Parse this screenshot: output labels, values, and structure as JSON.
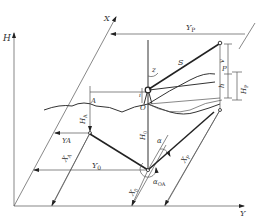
{
  "diagram": {
    "type": "surveying coordinate geometry diagram",
    "axes": {
      "vertical": "H",
      "horizontal": "Y",
      "oblique": "X"
    },
    "labels": {
      "Yp": "Y",
      "Yp_sub": "P",
      "S": "S",
      "z": "z",
      "v": "v",
      "P": "P",
      "h": "h",
      "Hp": "H",
      "Hp_sub": "P",
      "i": "i",
      "A": "A",
      "O": "O",
      "HA": "H",
      "HA_sub": "A",
      "H0": "H",
      "H0_sub": "0",
      "YA": "YA",
      "alpha": "α",
      "XA": "X",
      "XA_sub": "A",
      "Y0": "Y",
      "Y0_sub": "0",
      "Xp": "X",
      "Xp_sub": "P",
      "X0": "X",
      "X0_sub": "0",
      "alphaOA": "α",
      "alphaOA_sub": "OA"
    },
    "colors": {
      "line": "#333333",
      "background": "#ffffff"
    }
  }
}
